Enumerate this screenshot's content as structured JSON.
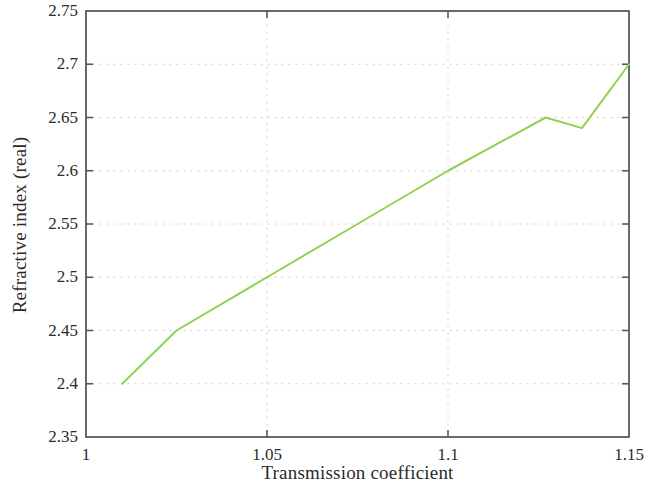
{
  "chart_data": {
    "type": "line",
    "title": "",
    "subtitle": "",
    "xlabel": "Transmission coefficient",
    "ylabel": "Refractive index (real)",
    "xlim": [
      1,
      1.15
    ],
    "ylim": [
      2.35,
      2.75
    ],
    "xticks": [
      1,
      1.05,
      1.1,
      1.15
    ],
    "xtick_labels": [
      "1",
      "1.05",
      "1.1",
      "1.15"
    ],
    "yticks": [
      2.35,
      2.4,
      2.45,
      2.5,
      2.55,
      2.6,
      2.65,
      2.7,
      2.75
    ],
    "ytick_labels": [
      "2.35",
      "2.4",
      "2.45",
      "2.5",
      "2.55",
      "2.6",
      "2.65",
      "2.7",
      "2.75"
    ],
    "grid": true,
    "grid_style": "dotted",
    "grid_color": "#c8c8c8",
    "legend": false,
    "legend_position": "none",
    "line_color": "#92d14f",
    "line_width": 2,
    "axis_color": "#595959",
    "background": "#ffffff",
    "series": [
      {
        "name": "Refractive index (real)",
        "x": [
          1.01,
          1.025,
          1.05,
          1.075,
          1.1,
          1.127,
          1.137,
          1.15
        ],
        "y": [
          2.4,
          2.45,
          2.5,
          2.55,
          2.6,
          2.65,
          2.64,
          2.7
        ]
      }
    ],
    "annotations": []
  }
}
